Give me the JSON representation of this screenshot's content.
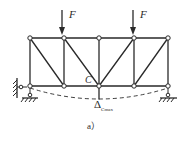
{
  "figure": {
    "caption": "a）",
    "colors": {
      "line": "#2a2a2a",
      "node_fill": "#ffffff",
      "background": "#ffffff"
    }
  },
  "truss": {
    "top_chord_y": 38,
    "bottom_chord_y": 86,
    "panel_x": [
      30,
      64,
      99,
      134,
      168
    ],
    "diagonals": [
      {
        "from": "top-0",
        "to": "bottom-1"
      },
      {
        "from": "top-1",
        "to": "bottom-2"
      },
      {
        "from": "bottom-2",
        "to": "top-3"
      },
      {
        "from": "bottom-3",
        "to": "top-4"
      }
    ]
  },
  "loads": [
    {
      "label": "F",
      "node": "top-1"
    },
    {
      "label": "F",
      "node": "top-3"
    }
  ],
  "labels": {
    "node_c": "C",
    "deflection_symbol": "Δ",
    "deflection_subscript": "Cmax"
  },
  "supports": {
    "left": "pin-with-horizontal-wall-link",
    "right": "pin"
  },
  "deflected_shape": "dashed"
}
